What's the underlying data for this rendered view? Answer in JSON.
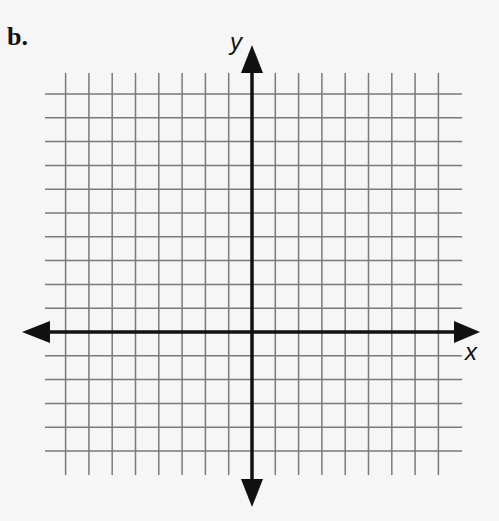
{
  "problem_label": "b.",
  "axes": {
    "x_label": "x",
    "y_label": "y"
  },
  "grid": {
    "columns_left_of_y_axis": 8,
    "columns_right_of_y_axis": 8,
    "rows_above_x_axis": 10,
    "rows_below_x_axis": 5,
    "line_color": "#7a7a7a",
    "axis_color": "#111111",
    "background": "#f6f6f6"
  }
}
